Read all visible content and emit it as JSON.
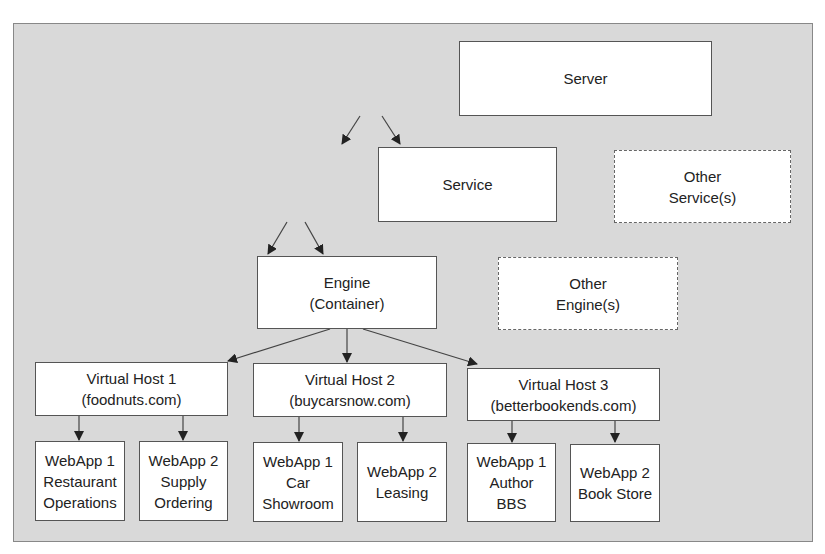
{
  "diagram": {
    "server": {
      "lines": [
        "Server"
      ]
    },
    "service": {
      "lines": [
        "Service"
      ]
    },
    "other_service": {
      "lines": [
        "Other",
        "Service(s)"
      ]
    },
    "engine": {
      "lines": [
        "Engine",
        "(Container)"
      ]
    },
    "other_engine": {
      "lines": [
        "Other",
        "Engine(s)"
      ]
    },
    "vhosts": [
      {
        "lines": [
          "Virtual Host 1",
          "(foodnuts.com)"
        ],
        "webapps": [
          {
            "lines": [
              "WebApp 1",
              "Restaurant",
              "Operations"
            ]
          },
          {
            "lines": [
              "WebApp 2",
              "Supply",
              "Ordering"
            ]
          }
        ]
      },
      {
        "lines": [
          "Virtual Host 2",
          "(buycarsnow.com)"
        ],
        "webapps": [
          {
            "lines": [
              "WebApp 1",
              "Car",
              "Showroom"
            ]
          },
          {
            "lines": [
              "WebApp 2",
              "Leasing"
            ]
          }
        ]
      },
      {
        "lines": [
          "Virtual Host 3",
          "(betterbookends.com)"
        ],
        "webapps": [
          {
            "lines": [
              "WebApp 1",
              "Author",
              "BBS"
            ]
          },
          {
            "lines": [
              "WebApp 2",
              "Book Store"
            ]
          }
        ]
      }
    ]
  }
}
